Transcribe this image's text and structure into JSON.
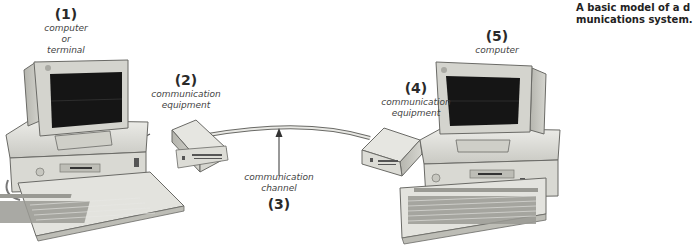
{
  "caption": {
    "line1": "A basic model of a d",
    "line2": "munications system."
  },
  "nodes": [
    {
      "number": "(1)",
      "label_lines": [
        "computer",
        "or",
        "terminal"
      ],
      "kind": "computer"
    },
    {
      "number": "(2)",
      "label_lines": [
        "communication",
        "equipment"
      ],
      "kind": "modem"
    },
    {
      "number": "(3)",
      "label_lines": [
        "communication",
        "channel"
      ],
      "kind": "channel"
    },
    {
      "number": "(4)",
      "label_lines": [
        "communication",
        "equipment"
      ],
      "kind": "modem"
    },
    {
      "number": "(5)",
      "label_lines": [
        "computer"
      ],
      "kind": "computer"
    }
  ],
  "colors": {
    "background": "#ffffff",
    "casing": "#dcdcd6",
    "casing_shadow": "#b9b9b2",
    "screen": "#151515",
    "outline": "#6a6a66",
    "text": "#2a2a2a"
  }
}
